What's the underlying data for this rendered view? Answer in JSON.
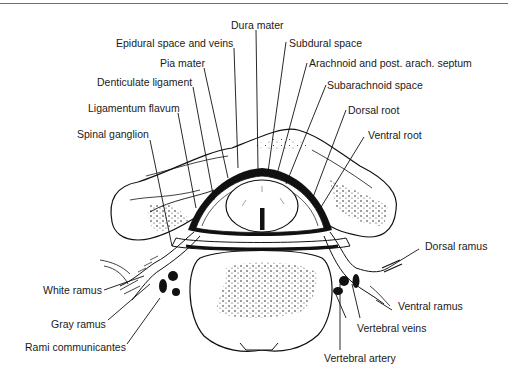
{
  "figure": {
    "stroke_color": "#111111",
    "background_color": "#ffffff"
  },
  "labels": {
    "dura_mater": "Dura mater",
    "epidural_space": "Epidural space and veins",
    "subdural_space": "Subdural space",
    "pia_mater": "Pia mater",
    "arachnoid": "Arachnoid and post. arach. septum",
    "denticulate_ligament": "Denticulate ligament",
    "subarachnoid_space": "Subarachnoid space",
    "ligamentum_flavum": "Ligamentum flavum",
    "dorsal_root": "Dorsal root",
    "spinal_ganglion": "Spinal ganglion",
    "ventral_root": "Ventral root",
    "dorsal_ramus": "Dorsal ramus",
    "white_ramus": "White ramus",
    "ventral_ramus": "Ventral ramus",
    "vertebral_veins": "Vertebral veins",
    "gray_ramus": "Gray ramus",
    "rami_communicantes": "Rami communicantes",
    "vertebral_artery": "Vertebral artery"
  }
}
